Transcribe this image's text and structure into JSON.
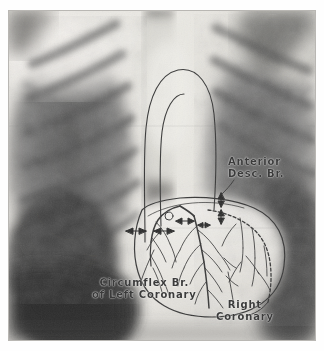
{
  "image": {
    "kind": "chest-radiograph",
    "view": "posteroanterior",
    "caption_visible": false,
    "plate_background": "#d8d6d2",
    "ink_color": "#3b3b3b"
  },
  "annotations": {
    "anterior_descending": {
      "line1": "Anterior",
      "line2": "Desc. Br.",
      "name": "Anterior Descending Branch"
    },
    "circumflex": {
      "line1": "Circumflex Br.",
      "line2": "of Left Coronary",
      "name": "Circumflex Branch of Left Coronary"
    },
    "right_coronary": {
      "line1": "Right",
      "line2": "Coronary",
      "name": "Right Coronary"
    }
  },
  "markers": {
    "arrow_pairs": 4,
    "arrow_style": "double-headed"
  },
  "drawing": {
    "structures": [
      "aortic-arch",
      "ascending-aorta",
      "cardiac-silhouette",
      "left-main-coronary",
      "anterior-descending-branch",
      "circumflex-branch",
      "right-coronary-artery"
    ]
  }
}
